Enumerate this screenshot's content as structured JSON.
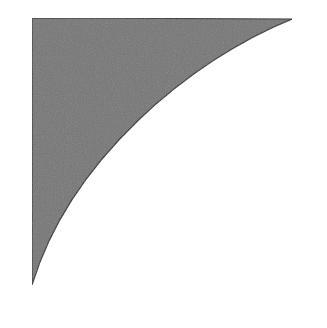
{
  "figure": {
    "shape": "curved-triangle",
    "fill_color": "#767676",
    "stroke_color": "#2e2e2e",
    "background_color": "#ffffff",
    "vertices": {
      "top_left": [
        32,
        18
      ],
      "top_right": [
        292,
        19
      ],
      "bottom_left": [
        32,
        285
      ]
    },
    "curve": {
      "from": [
        292,
        19
      ],
      "control1": [
        190,
        60
      ],
      "control2": [
        70,
        160
      ],
      "to": [
        32,
        285
      ]
    }
  }
}
